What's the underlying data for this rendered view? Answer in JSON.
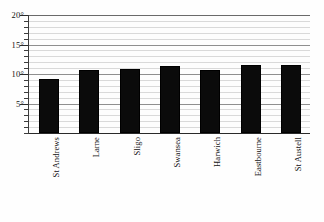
{
  "chart_data": {
    "type": "bar",
    "title": "",
    "subtitle": "",
    "xlabel": "",
    "ylabel": "",
    "categories": [
      "St Andrews",
      "Larne",
      "Sligo",
      "Swansea",
      "Harwich",
      "Eastbourne",
      "St Austell"
    ],
    "values": [
      9.2,
      10.6,
      10.8,
      11.3,
      10.7,
      11.5,
      11.6
    ],
    "series": [
      {
        "name": "Mean temperature",
        "values": [
          9.2,
          10.6,
          10.8,
          11.3,
          10.7,
          11.5,
          11.6
        ]
      }
    ],
    "ylim": [
      0,
      20
    ],
    "xlim": [
      0,
      7
    ],
    "y_major_ticks": [
      5,
      10,
      15,
      20
    ],
    "y_major_tick_labels": [
      "5°",
      "10°",
      "15°",
      "20°"
    ],
    "y_minor_tick_step": 1,
    "unit": "°",
    "grid": true,
    "grid_axis": "y",
    "legend": false,
    "legend_position": "none",
    "bar_color": "#0b0b0b",
    "grid_color": "#d9d9d9",
    "axis_color": "#2a2a2a",
    "background_color": "#fdfdfd",
    "annotations": []
  },
  "axes": {
    "y": {
      "ticks": [
        {
          "value": 20,
          "label": "20°"
        },
        {
          "value": 15,
          "label": "15°"
        },
        {
          "value": 10,
          "label": "10°"
        },
        {
          "value": 5,
          "label": "5°"
        }
      ]
    },
    "x": {
      "ticks": [
        {
          "label": "St Andrews"
        },
        {
          "label": "Larne"
        },
        {
          "label": "Sligo"
        },
        {
          "label": "Swansea"
        },
        {
          "label": "Harwich"
        },
        {
          "label": "Eastbourne"
        },
        {
          "label": "St Austell"
        }
      ]
    }
  }
}
